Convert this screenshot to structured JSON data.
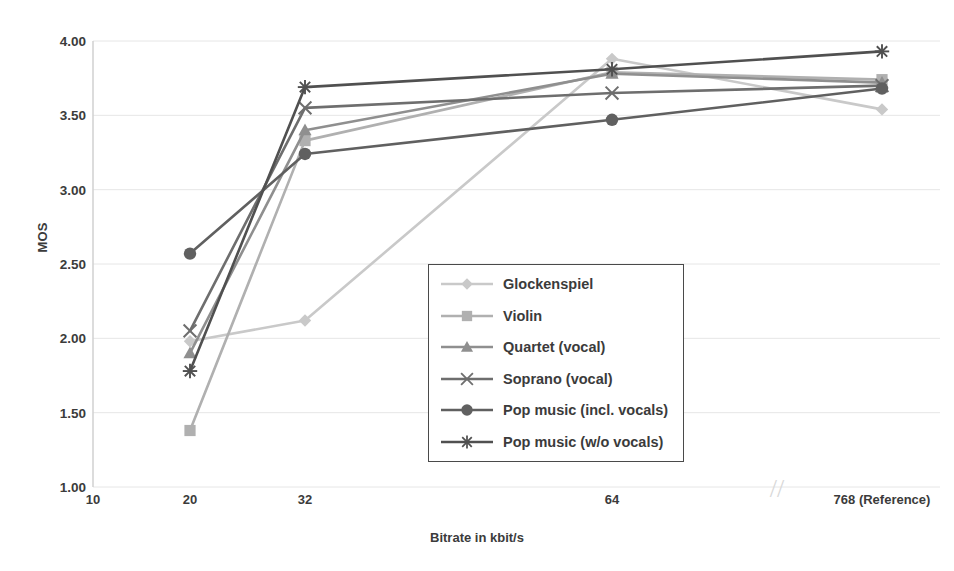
{
  "chart_data": {
    "type": "line",
    "title": "",
    "xlabel": "Bitrate in kbit/s",
    "ylabel": "MOS",
    "categories": [
      "10",
      "20",
      "32",
      "64",
      "768 (Reference)"
    ],
    "x_tick_labels": [
      "10",
      "20",
      "32",
      "64",
      "768 (Reference)"
    ],
    "y_tick_labels": [
      "1.00",
      "1.50",
      "2.00",
      "2.50",
      "3.00",
      "3.50",
      "4.00"
    ],
    "y_ticks": [
      1.0,
      1.5,
      2.0,
      2.5,
      3.0,
      3.5,
      4.0
    ],
    "ylim": [
      1.0,
      4.0
    ],
    "grid": true,
    "grid_axis": "y",
    "legend_position": "center",
    "axis_break": true,
    "axis_break_label": "//",
    "series": [
      {
        "name": "Glockenspiel",
        "marker": "diamond",
        "color": "#c9c9c9",
        "points": [
          {
            "x": "20",
            "y": 1.98
          },
          {
            "x": "32",
            "y": 2.12
          },
          {
            "x": "64",
            "y": 3.88
          },
          {
            "x": "768 (Reference)",
            "y": 3.54
          }
        ]
      },
      {
        "name": "Violin",
        "marker": "square",
        "color": "#b0b0b0",
        "points": [
          {
            "x": "20",
            "y": 1.38
          },
          {
            "x": "32",
            "y": 3.33
          },
          {
            "x": "64",
            "y": 3.79
          },
          {
            "x": "768 (Reference)",
            "y": 3.74
          }
        ]
      },
      {
        "name": "Quartet (vocal)",
        "marker": "triangle",
        "color": "#8f8f8f",
        "points": [
          {
            "x": "20",
            "y": 1.9
          },
          {
            "x": "32",
            "y": 3.4
          },
          {
            "x": "64",
            "y": 3.78
          },
          {
            "x": "768 (Reference)",
            "y": 3.72
          }
        ]
      },
      {
        "name": "Soprano (vocal)",
        "marker": "x",
        "color": "#6e6e6e",
        "points": [
          {
            "x": "20",
            "y": 2.05
          },
          {
            "x": "32",
            "y": 3.55
          },
          {
            "x": "64",
            "y": 3.65
          },
          {
            "x": "768 (Reference)",
            "y": 3.7
          }
        ]
      },
      {
        "name": "Pop music (incl. vocals)",
        "marker": "circle",
        "color": "#606060",
        "points": [
          {
            "x": "20",
            "y": 2.57
          },
          {
            "x": "32",
            "y": 3.24
          },
          {
            "x": "64",
            "y": 3.47
          },
          {
            "x": "768 (Reference)",
            "y": 3.68
          }
        ]
      },
      {
        "name": "Pop music (w/o vocals)",
        "marker": "asterisk",
        "color": "#505050",
        "points": [
          {
            "x": "20",
            "y": 1.78
          },
          {
            "x": "32",
            "y": 3.69
          },
          {
            "x": "64",
            "y": 3.81
          },
          {
            "x": "768 (Reference)",
            "y": 3.93
          }
        ]
      }
    ]
  },
  "legend": {
    "items": [
      {
        "label": "Glockenspiel"
      },
      {
        "label": "Violin"
      },
      {
        "label": "Quartet (vocal)"
      },
      {
        "label": "Soprano (vocal)"
      },
      {
        "label": "Pop music (incl. vocals)"
      },
      {
        "label": "Pop music (w/o vocals)"
      }
    ]
  },
  "colors": {
    "background": "#ffffff",
    "text": "#3b3b3b",
    "grid": "#e6e6e6",
    "axis": "#d0d0d0",
    "legend_border": "#4a4a4a"
  }
}
